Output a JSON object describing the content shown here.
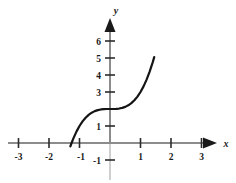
{
  "figure": {
    "background_color": "#ffffff",
    "axis_color": "#8c8c8c",
    "tick_color": "#2b2b2b",
    "curve_color": "#141414",
    "label_color": "#1a1a1a",
    "x_axis_label": "x",
    "y_axis_label": "y"
  },
  "chart_data": {
    "type": "line",
    "title": "",
    "subtitle": "",
    "xlabel": "x",
    "ylabel": "y",
    "xlim": [
      -3.4,
      3.4
    ],
    "ylim": [
      -1.6,
      6.8
    ],
    "grid": false,
    "legend": null,
    "x_ticks": [
      -3,
      -2,
      -1,
      1,
      2,
      3
    ],
    "x_tick_labels": [
      "-3",
      "-2",
      "-1",
      "1",
      "2",
      "3"
    ],
    "y_ticks": [
      -1,
      1,
      2,
      3,
      4,
      5,
      6
    ],
    "y_tick_labels": [
      "-1",
      "1",
      "",
      "3",
      "4",
      "5",
      "6"
    ],
    "y_tick_label_hidden_note": "tick at y=2 is unlabeled (obscured by curve)",
    "annotations": [
      "inflection point at (0, 2)",
      "x-intercept near x = -1.26",
      "curve drawn from x = -1.3 to x = 1.45"
    ],
    "series": [
      {
        "name": "y = x^3 + 2",
        "equation": "y = x^3 + 2",
        "x": [
          -1.3,
          -1.26,
          -1.2,
          -1.1,
          -1.0,
          -0.9,
          -0.8,
          -0.7,
          -0.6,
          -0.5,
          -0.4,
          -0.3,
          -0.2,
          -0.1,
          0.0,
          0.1,
          0.2,
          0.3,
          0.4,
          0.5,
          0.6,
          0.7,
          0.8,
          0.9,
          1.0,
          1.1,
          1.2,
          1.3,
          1.4,
          1.45
        ],
        "y": [
          -0.197,
          0.0,
          0.272,
          0.669,
          1.0,
          1.271,
          1.488,
          1.657,
          1.784,
          1.875,
          1.936,
          1.973,
          1.992,
          1.999,
          2.0,
          2.001,
          2.008,
          2.027,
          2.064,
          2.125,
          2.216,
          2.343,
          2.512,
          2.729,
          3.0,
          3.331,
          3.728,
          4.197,
          4.744,
          5.048
        ]
      }
    ]
  }
}
